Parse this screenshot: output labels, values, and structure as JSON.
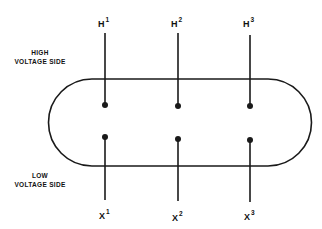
{
  "diagram": {
    "type": "transformer-terminal-layout",
    "line_color": "#1a1a1a",
    "high_side": {
      "label_line1": "HIGH",
      "label_line2": "VOLTAGE SIDE",
      "terminals": [
        {
          "base": "H",
          "sup": "1"
        },
        {
          "base": "H",
          "sup": "2"
        },
        {
          "base": "H",
          "sup": "3"
        }
      ]
    },
    "low_side": {
      "label_line1": "LOW",
      "label_line2": "VOLTAGE SIDE",
      "terminals": [
        {
          "base": "X",
          "sup": "1"
        },
        {
          "base": "X",
          "sup": "2"
        },
        {
          "base": "X",
          "sup": "3"
        }
      ]
    }
  }
}
